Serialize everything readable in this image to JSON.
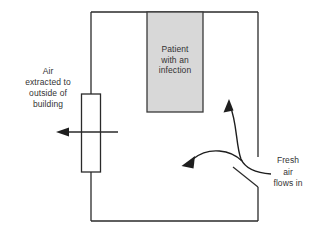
{
  "labels": {
    "air_extracted": "Air\nextracted to\noutside of\nbuilding",
    "patient": "Patient\nwith an\ninfection",
    "fresh_air": "Fresh\nair\nflows in"
  },
  "icons": {
    "extract_arrow": "left-arrow",
    "fresh_air_up_arrow": "up-arrow",
    "fresh_air_left_arrow": "left-arrow"
  },
  "colors": {
    "line": "#2a2a2a",
    "patient_box_fill": "#d8d8d8",
    "patient_box_stroke": "#3a3a3a",
    "background": "#ffffff",
    "text": "#333333"
  }
}
